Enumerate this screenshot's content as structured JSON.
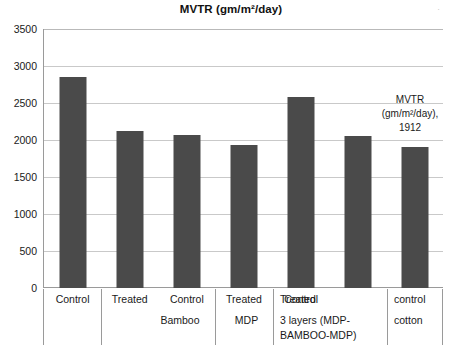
{
  "chart_data": {
    "type": "bar",
    "title": "MVTR (gm/m²/day)",
    "xlabel": "",
    "ylabel": "",
    "ylim": [
      0,
      3500
    ],
    "ytick_step": 500,
    "grid": true,
    "legend": "none",
    "bar_color": "#4a4a4a",
    "categories": [
      "Control",
      "Treated",
      "Control",
      "Treated",
      "Control",
      "Treated",
      "control"
    ],
    "group_labels": [
      "",
      "Bamboo",
      "",
      "MDP",
      "",
      "3 layers (MDP-BAMBOO-MDP)",
      "cotton"
    ],
    "values": [
      2860,
      2130,
      2080,
      1940,
      2590,
      2060,
      1912
    ],
    "yticks": [
      "0",
      "500",
      "1000",
      "1500",
      "2000",
      "2500",
      "3000",
      "3500"
    ],
    "annotations": [
      {
        "lines": [
          "MVTR",
          "(gm/m²/day),",
          "1912"
        ],
        "target_category": "control cotton",
        "value": 1912
      }
    ]
  },
  "axis": {
    "groups_level2": [
      {
        "label": "Bamboo"
      },
      {
        "label": "MDP"
      },
      {
        "label": "3 layers (MDP-"
      },
      {
        "label": "BAMBOO-MDP)"
      },
      {
        "label": "cotton"
      }
    ]
  },
  "artifacts": {
    "scan_mark": "·"
  }
}
